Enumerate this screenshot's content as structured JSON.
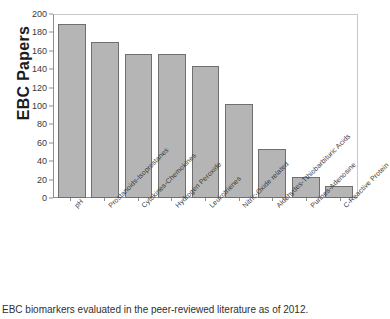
{
  "chart_data": {
    "type": "bar",
    "title": "",
    "xlabel": "",
    "ylabel": "EBC Papers",
    "ylim": [
      0,
      200
    ],
    "yticks": [
      0,
      20,
      40,
      60,
      80,
      100,
      120,
      140,
      160,
      180,
      200
    ],
    "grid": false,
    "legend": null,
    "categories": [
      "pH",
      "Prostanoids-Isoprostanes",
      "Cytokines-Chemokines",
      "Hydrogen Peroxide",
      "Leukotrienes",
      "Nitric-Oxide related",
      "Aldehydes-Tthiobarbituric Acids",
      "Purines-Adenosine",
      "C-Reactive Protein"
    ],
    "values": [
      189,
      170,
      156,
      157,
      143,
      102,
      53,
      23,
      13
    ],
    "bar_color": "#b5b5b5",
    "bar_edge_color": "#6f6f6f",
    "axis_color": "#8e8e8e"
  },
  "caption": {
    "text": "EBC biomarkers evaluated in the peer-reviewed literature as of 2012."
  }
}
